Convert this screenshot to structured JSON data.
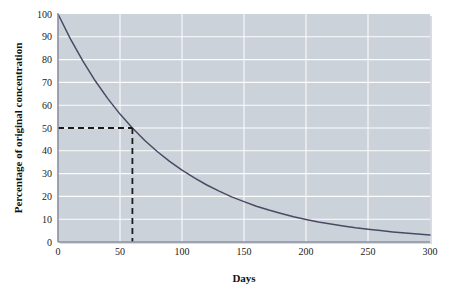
{
  "figure": {
    "background_color": "#ffffff",
    "plot_area_color": "#ccd2da",
    "gridline_color": "#ffffff",
    "curve_color": "#4a4a63",
    "dashed_guide_color": "#1c1c1c",
    "axis_color": "#8a90a0"
  },
  "chart_data": {
    "type": "line",
    "title": "",
    "subtitle": "",
    "xlabel": "Days",
    "ylabel": "Percentage of original concentration",
    "xlim": [
      0,
      300
    ],
    "ylim": [
      0,
      100
    ],
    "grid": true,
    "legend": null,
    "legend_position": "none",
    "x_ticks": [
      0,
      50,
      100,
      150,
      200,
      250,
      300
    ],
    "x_tick_labels": [
      "0",
      "50",
      "100",
      "150",
      "200",
      "250",
      "300"
    ],
    "y_ticks": [
      0,
      10,
      20,
      30,
      40,
      50,
      60,
      70,
      80,
      90,
      100
    ],
    "y_tick_labels": [
      "0",
      "10",
      "20",
      "30",
      "40",
      "50",
      "60",
      "70",
      "80",
      "90",
      "100"
    ],
    "series": [
      {
        "name": "Percentage of original concentration",
        "color": "#4a4a63",
        "x": [
          0,
          10,
          20,
          30,
          40,
          50,
          60,
          70,
          80,
          90,
          100,
          110,
          120,
          130,
          140,
          150,
          160,
          170,
          180,
          190,
          200,
          210,
          220,
          230,
          240,
          250,
          260,
          270,
          280,
          290,
          300
        ],
        "values": [
          100.0,
          89.1,
          79.4,
          70.7,
          63.0,
          56.1,
          50.0,
          44.5,
          39.7,
          35.4,
          31.5,
          28.1,
          25.0,
          22.3,
          19.8,
          17.7,
          15.7,
          14.0,
          12.5,
          11.1,
          9.9,
          8.8,
          7.9,
          7.0,
          6.2,
          5.6,
          5.0,
          4.4,
          3.9,
          3.5,
          3.1
        ]
      }
    ],
    "annotations": [
      {
        "name": "half-life-guide",
        "type": "dashed-crosshair",
        "x": 60,
        "y": 50,
        "label": ""
      }
    ]
  }
}
